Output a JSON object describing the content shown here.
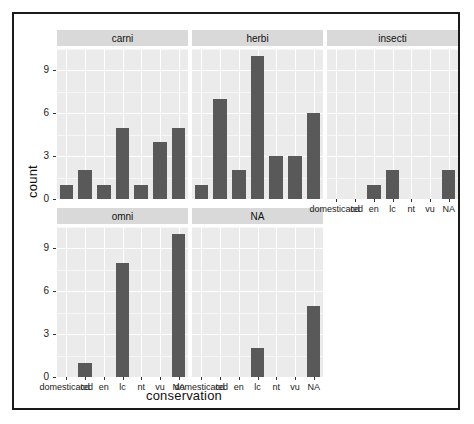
{
  "chart_data": {
    "type": "bar",
    "title": "",
    "xlabel": "conservation",
    "ylabel": "count",
    "ylim": [
      0,
      10.5
    ],
    "yticks": [
      0,
      3,
      6,
      9
    ],
    "grid": true,
    "legend": "none",
    "facet_variable": "vore",
    "categories": [
      "domesticated",
      "cd",
      "en",
      "lc",
      "nt",
      "vu",
      "NA"
    ],
    "facets": [
      {
        "label": "carni",
        "row": 0,
        "col": 0,
        "values": [
          1,
          2,
          1,
          5,
          1,
          4,
          5
        ]
      },
      {
        "label": "herbi",
        "row": 0,
        "col": 1,
        "values": [
          1,
          7,
          2,
          10,
          3,
          3,
          6
        ]
      },
      {
        "label": "insecti",
        "row": 0,
        "col": 2,
        "values": [
          0,
          0,
          1,
          2,
          0,
          0,
          2
        ]
      },
      {
        "label": "omni",
        "row": 1,
        "col": 0,
        "values": [
          0,
          1,
          0,
          8,
          0,
          0,
          10
        ]
      },
      {
        "label": "NA",
        "row": 1,
        "col": 1,
        "values": [
          0,
          0,
          0,
          2,
          0,
          0,
          5
        ]
      }
    ],
    "colors": {
      "bar_fill": "#595959",
      "panel_background": "#ebebeb",
      "strip_background": "#d9d9d9",
      "gridline_major": "#ffffff",
      "gridline_minor": "#f7f7f7",
      "text": "#222222",
      "frame_border": "#1a1a1a"
    }
  }
}
